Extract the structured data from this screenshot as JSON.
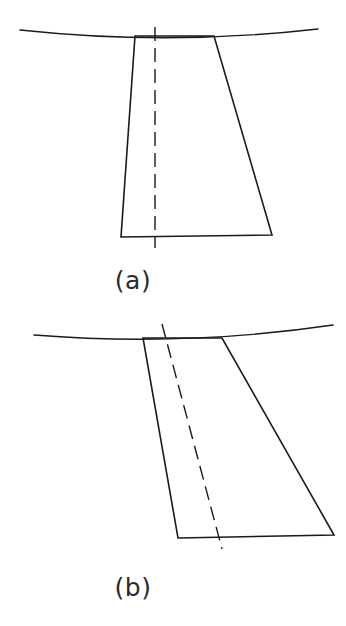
{
  "figure": {
    "background_color": "#ffffff",
    "stroke_color": "#1a1a1a",
    "width": 346,
    "height": 626
  },
  "panels": [
    {
      "id": "a",
      "caption": "(a)",
      "caption_position": {
        "x": 133,
        "y": 285
      },
      "description": "Symmetric tapered section with vertical dashed centerline crossing a slightly sagging surface curve",
      "surface_curve": {
        "name": "surface-line-a",
        "start": {
          "x": 20,
          "y": 30
        },
        "control": {
          "x": 169,
          "y": 46
        },
        "end": {
          "x": 318,
          "y": 29
        },
        "sag": "downward bow, lowest near center"
      },
      "section_outline": {
        "name": "section-outline-a",
        "points": [
          {
            "x": 135,
            "y": 36
          },
          {
            "x": 214,
            "y": 36
          },
          {
            "x": 272,
            "y": 235
          },
          {
            "x": 121,
            "y": 237
          }
        ],
        "closed": true,
        "top_width": 79,
        "bottom_width": 151,
        "height": 200
      },
      "centerline": {
        "name": "centerline-a",
        "start": {
          "x": 155,
          "y": 27
        },
        "end": {
          "x": 155,
          "y": 248
        },
        "style": "dashed",
        "orientation": "vertical",
        "tilt_degrees": 0
      }
    },
    {
      "id": "b",
      "caption": "(b)",
      "caption_position": {
        "x": 133,
        "y": 592
      },
      "description": "Skewed tapered section with slanted dashed centerline crossing a slightly sagging surface curve",
      "surface_curve": {
        "name": "surface-line-b",
        "start": {
          "x": 34,
          "y": 335
        },
        "control": {
          "x": 184,
          "y": 347
        },
        "end": {
          "x": 333,
          "y": 325
        },
        "sag": "downward bow, lowest near center"
      },
      "section_outline": {
        "name": "section-outline-b",
        "points": [
          {
            "x": 143,
            "y": 338
          },
          {
            "x": 222,
            "y": 338
          },
          {
            "x": 334,
            "y": 535
          },
          {
            "x": 178,
            "y": 538
          }
        ],
        "closed": true,
        "top_width": 79,
        "bottom_width": 156,
        "height": 199
      },
      "centerline": {
        "name": "centerline-b",
        "start": {
          "x": 162,
          "y": 324
        },
        "end": {
          "x": 222,
          "y": 549
        },
        "style": "dashed",
        "orientation": "slanted",
        "tilt_degrees": 15
      }
    }
  ],
  "style": {
    "line_width_outline": 1.6,
    "line_width_surface": 1.4,
    "dash_pattern": "14 7",
    "caption_font_size": 25
  }
}
